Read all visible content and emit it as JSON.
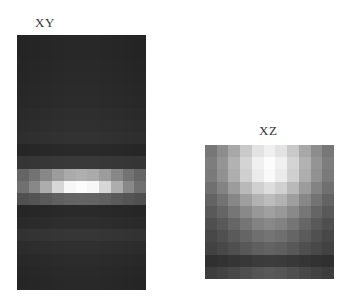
{
  "figure": {
    "panels": [
      {
        "label": "XY",
        "label_pos": [
          35,
          15
        ],
        "rect": [
          17,
          35,
          129,
          255
        ],
        "cols": 11,
        "rows": 21,
        "row_profile": [
          38,
          38,
          39,
          40,
          41,
          42,
          44,
          46,
          48,
          40,
          55,
          95,
          135,
          70,
          40,
          44,
          52,
          46,
          42,
          40,
          39
        ],
        "col_profile": [
          0.55,
          0.65,
          0.78,
          0.9,
          0.98,
          1.0,
          0.98,
          0.9,
          0.78,
          0.65,
          0.55
        ]
      },
      {
        "label": "XZ",
        "label_pos": [
          259,
          123
        ],
        "rect": [
          205,
          145,
          129,
          134
        ],
        "cols": 11,
        "rows": 11,
        "row_profile": [
          0.95,
          1.0,
          0.98,
          0.88,
          0.76,
          0.65,
          0.55,
          0.46,
          0.38,
          0.22,
          0.32
        ],
        "col_profile": [
          0.5,
          0.6,
          0.72,
          0.85,
          0.95,
          1.0,
          0.95,
          0.85,
          0.72,
          0.6,
          0.5
        ]
      }
    ]
  }
}
